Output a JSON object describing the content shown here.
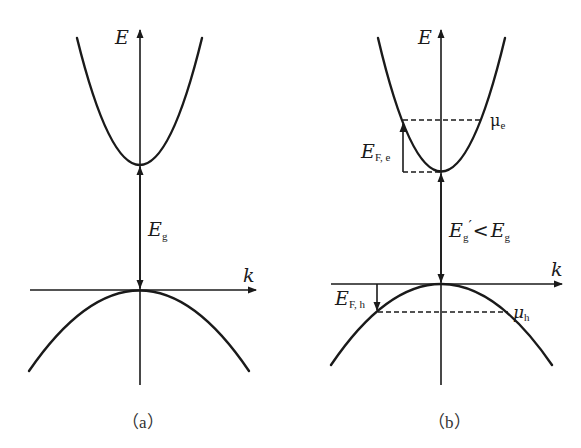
{
  "panel_a": {
    "caption": "（a）",
    "axis_energy_label": "E",
    "axis_k_label": "k",
    "gap_label": "E",
    "gap_label_sub": "g"
  },
  "panel_b": {
    "caption": "（b）",
    "axis_energy_label": "E",
    "axis_k_label": "k",
    "gap_label_main": "E",
    "gap_label_sub": "g",
    "gap_label_prime": "′",
    "gap_label_rel": "<",
    "gap_label_cmp": "E",
    "gap_label_cmp_sub": "g",
    "electron_fermi_label": "E",
    "electron_fermi_sub": "F, e",
    "hole_fermi_label": "E",
    "hole_fermi_sub": "F, h",
    "electron_chem_label": "μ",
    "electron_chem_sub": "e",
    "hole_chem_label": "μ",
    "hole_chem_sub": "h"
  },
  "colors": {
    "line": "#1a1a1a",
    "background": "#ffffff"
  }
}
